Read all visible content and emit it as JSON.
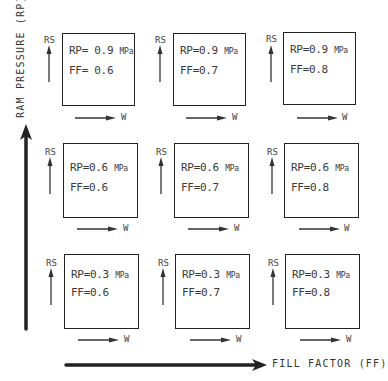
{
  "axes": {
    "y_label": "RAM PRESSURE (RP)",
    "x_label": "FILL FACTOR (FF)"
  },
  "cell_axes": {
    "vertical": "RS",
    "horizontal": "W"
  },
  "grid": [
    {
      "row": 0,
      "col": 0,
      "rp": "RP= 0.9",
      "unit": "MPa",
      "ff": "FF= 0.6"
    },
    {
      "row": 0,
      "col": 1,
      "rp": "RP=0.9",
      "unit": "MPa",
      "ff": "FF=0.7"
    },
    {
      "row": 0,
      "col": 2,
      "rp": "RP=0.9",
      "unit": "MPa",
      "ff": "FF=0.8"
    },
    {
      "row": 1,
      "col": 0,
      "rp": "RP=0.6",
      "unit": "MPa",
      "ff": "FF=0.6"
    },
    {
      "row": 1,
      "col": 1,
      "rp": "RP=0.6",
      "unit": "MPa",
      "ff": "FF=0.7"
    },
    {
      "row": 1,
      "col": 2,
      "rp": "RP=0.6",
      "unit": "MPa",
      "ff": "FF=0.8"
    },
    {
      "row": 2,
      "col": 0,
      "rp": "RP=0.3",
      "unit": "MPa",
      "ff": "FF=0.6"
    },
    {
      "row": 2,
      "col": 1,
      "rp": "RP=0.3",
      "unit": "MPa",
      "ff": "FF=0.7"
    },
    {
      "row": 2,
      "col": 2,
      "rp": "RP=0.3",
      "unit": "MPa",
      "ff": "FF=0.8"
    }
  ]
}
